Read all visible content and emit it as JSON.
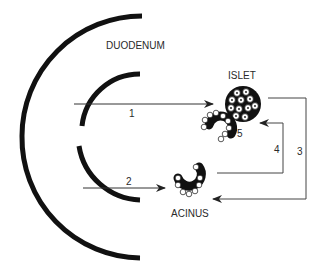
{
  "diagram": {
    "labels": {
      "duodenum": "DUODENUM",
      "islet": "ISLET",
      "acinus": "ACINUS"
    },
    "pathways": [
      {
        "id": "1",
        "label": "1",
        "from": "duodenum",
        "to": "islet"
      },
      {
        "id": "2",
        "label": "2",
        "from": "duodenum",
        "to": "acinus"
      },
      {
        "id": "3",
        "label": "3",
        "from": "islet",
        "to": "acinus"
      },
      {
        "id": "4",
        "label": "4",
        "from": "acinus",
        "to": "islet"
      },
      {
        "id": "5",
        "label": "5",
        "from": "islet",
        "to": "adjacent-acinus"
      }
    ],
    "colors": {
      "stroke": "#111111",
      "line": "#555555",
      "background": "#ffffff"
    }
  }
}
